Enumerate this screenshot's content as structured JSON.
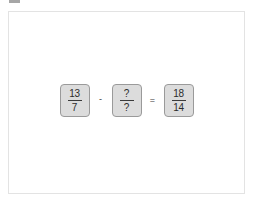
{
  "frame": {
    "background_color": "#ffffff",
    "border_color": "#e3e3e3"
  },
  "artifact": {
    "name": "top-left-gray-bar",
    "color": "#a6a6a6"
  },
  "equation": {
    "terms": [
      {
        "type": "fraction",
        "numerator": "13",
        "denominator": "7"
      },
      {
        "type": "fraction",
        "numerator": "?",
        "denominator": "?"
      },
      {
        "type": "fraction",
        "numerator": "18",
        "denominator": "14"
      }
    ],
    "operators": {
      "minus": "-",
      "equals": "="
    },
    "box_fill_color": "#dcdcdc",
    "box_border_color": "#9a9a9a",
    "text_color": "#2b2b2b"
  }
}
